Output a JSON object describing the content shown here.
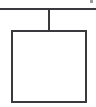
{
  "canvas": {
    "width": 96,
    "height": 107,
    "background_color": "#ffffff"
  },
  "diagram": {
    "title": "",
    "type": "node-tree-fragment",
    "stroke_color": "#3a3a3e",
    "stroke_color_light": "#55555a",
    "fill_color": "#ffffff",
    "elements": [
      {
        "name": "parent-bus-line",
        "kind": "horizontal-line",
        "label": "",
        "x1": 0,
        "y1": 9,
        "x2": 96,
        "y2": 9,
        "thickness": 2
      },
      {
        "name": "connector-line",
        "kind": "vertical-line",
        "label": "",
        "x1": 49,
        "y1": 9,
        "x2": 49,
        "y2": 32,
        "thickness": 2
      },
      {
        "name": "node-box",
        "kind": "rectangle",
        "label": "",
        "x": 12,
        "y": 31,
        "width": 74,
        "height": 71,
        "thickness": 2,
        "fill": "#ffffff"
      },
      {
        "name": "corner-artifact-mark",
        "kind": "mark",
        "label": "",
        "x": 90,
        "y": 0,
        "width": 4,
        "height": 4
      }
    ]
  }
}
